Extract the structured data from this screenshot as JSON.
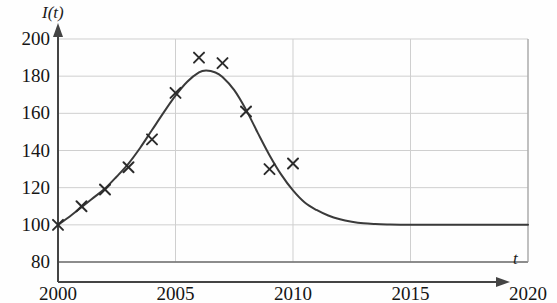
{
  "figure": {
    "y_axis_title": "I(t)",
    "x_axis_title": "t",
    "background_color": "#fefefe",
    "curve_color": "#3a3a3a",
    "marker_color": "#2b2b2b",
    "grid_color": "#cfcfcf",
    "axis_color": "#444444"
  },
  "chart_data": {
    "type": "line",
    "title": "",
    "subtitle": "",
    "xlabel": "t",
    "ylabel": "I(t)",
    "xlim": [
      2000,
      2020
    ],
    "ylim": [
      80,
      200
    ],
    "grid": true,
    "legend": "none",
    "x_ticks": [
      2000,
      2005,
      2010,
      2015,
      2020
    ],
    "x_tick_labels": [
      "2000",
      "2005",
      "2010",
      "2015",
      "2020"
    ],
    "y_ticks": [
      80,
      100,
      120,
      140,
      160,
      180,
      200
    ],
    "y_tick_labels": [
      "80",
      "100",
      "120",
      "140",
      "160",
      "180",
      "200"
    ],
    "series": [
      {
        "name": "model curve",
        "type": "line",
        "points": [
          [
            2000.0,
            100.0
          ],
          [
            2000.5,
            104.5
          ],
          [
            2001.0,
            109.5
          ],
          [
            2001.5,
            114.5
          ],
          [
            2002.0,
            119.5
          ],
          [
            2002.5,
            126.0
          ],
          [
            2003.0,
            133.0
          ],
          [
            2003.5,
            141.5
          ],
          [
            2004.0,
            151.0
          ],
          [
            2004.5,
            160.5
          ],
          [
            2005.0,
            169.5
          ],
          [
            2005.5,
            177.0
          ],
          [
            2006.0,
            182.0
          ],
          [
            2006.3,
            183.0
          ],
          [
            2006.7,
            182.0
          ],
          [
            2007.0,
            179.5
          ],
          [
            2007.5,
            172.5
          ],
          [
            2008.0,
            162.0
          ],
          [
            2008.5,
            149.5
          ],
          [
            2009.0,
            137.5
          ],
          [
            2009.5,
            127.0
          ],
          [
            2010.0,
            118.5
          ],
          [
            2010.5,
            112.0
          ],
          [
            2011.0,
            108.0
          ],
          [
            2011.5,
            105.0
          ],
          [
            2012.0,
            103.0
          ],
          [
            2012.5,
            101.7
          ],
          [
            2013.0,
            100.8
          ],
          [
            2013.5,
            100.4
          ],
          [
            2014.0,
            100.2
          ],
          [
            2015.0,
            100.0
          ],
          [
            2017.0,
            100.0
          ],
          [
            2020.0,
            100.0
          ]
        ]
      },
      {
        "name": "observed data",
        "type": "scatter",
        "marker": "x",
        "points": [
          [
            2000,
            100
          ],
          [
            2001,
            110
          ],
          [
            2002,
            119
          ],
          [
            2003,
            131
          ],
          [
            2004,
            146
          ],
          [
            2005,
            171
          ],
          [
            2006,
            190
          ],
          [
            2007,
            187
          ],
          [
            2008,
            161
          ],
          [
            2009,
            130
          ],
          [
            2010,
            133
          ]
        ]
      }
    ]
  }
}
